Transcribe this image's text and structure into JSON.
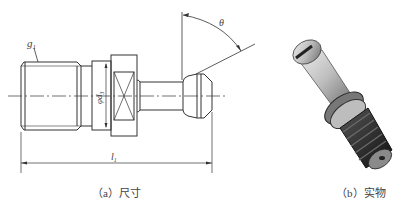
{
  "figure": {
    "panel_a": {
      "caption": "（a）尺寸",
      "labels": {
        "thread": "g",
        "thread_sub": "1",
        "diameter": "φd",
        "diameter_sub": "3",
        "length": "l",
        "length_sub": "1",
        "angle": "θ"
      }
    },
    "panel_b": {
      "caption": "（b）实物"
    }
  }
}
